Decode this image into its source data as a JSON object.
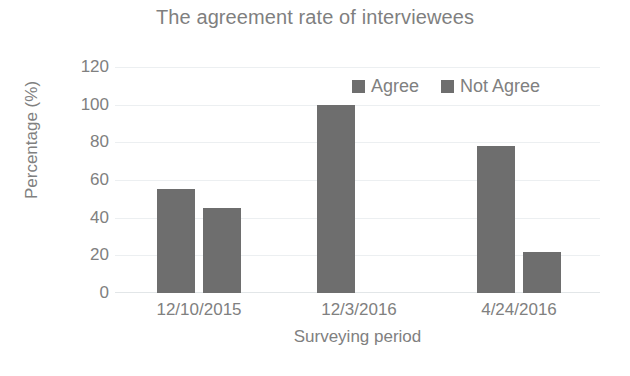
{
  "chart_data": {
    "type": "bar",
    "title": "The agreement rate of interviewees",
    "xlabel": "Surveying period",
    "ylabel": "Percentage (%)",
    "categories": [
      "12/10/2015",
      "12/3/2016",
      "4/24/2016"
    ],
    "series": [
      {
        "name": "Agree",
        "values": [
          55,
          100,
          78
        ],
        "color": "#6e6e6e"
      },
      {
        "name": "Not Agree",
        "values": [
          45,
          0,
          22
        ],
        "color": "#6e6e6e"
      }
    ],
    "ylim": [
      0,
      120
    ],
    "yticks": [
      0,
      20,
      40,
      60,
      80,
      100,
      120
    ],
    "ytick_labels": [
      "0",
      "20",
      "40",
      "60",
      "80",
      "100",
      "120"
    ],
    "grid": true,
    "legend_position": "top-right",
    "bar_color": "#6e6e6e",
    "text_color": "#808080",
    "grid_color": "#eceff1",
    "background": "#ffffff"
  }
}
